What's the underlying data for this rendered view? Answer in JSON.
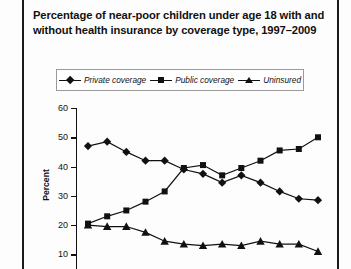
{
  "figure": {
    "title": "Percentage of near-poor children under age 18 with and without health insurance by coverage type, 1997–2009",
    "axis_color": "#111111",
    "background": "#ffffff"
  },
  "legend": {
    "position": "top-center",
    "items": [
      {
        "label": "Private coverage",
        "marker": "diamond",
        "color": "#111111"
      },
      {
        "label": "Public coverage",
        "marker": "square",
        "color": "#111111"
      },
      {
        "label": "Uninsured",
        "marker": "triangle",
        "color": "#111111"
      }
    ]
  },
  "y_axis": {
    "label": "Percent",
    "ticks": [
      60,
      50,
      40,
      30,
      20,
      10
    ],
    "min": 5,
    "max": 60
  },
  "chart_data": {
    "type": "line",
    "title": "Percentage of near-poor children under age 18 with and without health insurance by coverage type, 1997–2009",
    "xlabel": "",
    "ylabel": "Percent",
    "ylim": [
      5,
      60
    ],
    "grid": false,
    "legend_position": "top-center",
    "x": [
      1997,
      1998,
      1999,
      2000,
      2001,
      2002,
      2003,
      2004,
      2005,
      2006,
      2007,
      2008,
      2009
    ],
    "categories": [
      "1997",
      "1998",
      "1999",
      "2000",
      "2001",
      "2002",
      "2003",
      "2004",
      "2005",
      "2006",
      "2007",
      "2008",
      "2009"
    ],
    "series": [
      {
        "name": "Private coverage",
        "marker": "diamond",
        "values": [
          47.0,
          48.5,
          45.0,
          42.0,
          42.0,
          39.0,
          37.5,
          34.5,
          37.0,
          34.5,
          31.5,
          29.0,
          28.5
        ]
      },
      {
        "name": "Public coverage",
        "marker": "square",
        "values": [
          20.5,
          23.0,
          25.0,
          28.0,
          31.5,
          39.5,
          40.5,
          37.0,
          39.5,
          42.0,
          45.5,
          46.0,
          50.0
        ]
      },
      {
        "name": "Uninsured",
        "marker": "triangle",
        "values": [
          20.0,
          19.5,
          19.5,
          17.5,
          14.5,
          13.5,
          13.0,
          13.5,
          13.0,
          14.5,
          13.5,
          13.5,
          11.0
        ]
      }
    ]
  }
}
